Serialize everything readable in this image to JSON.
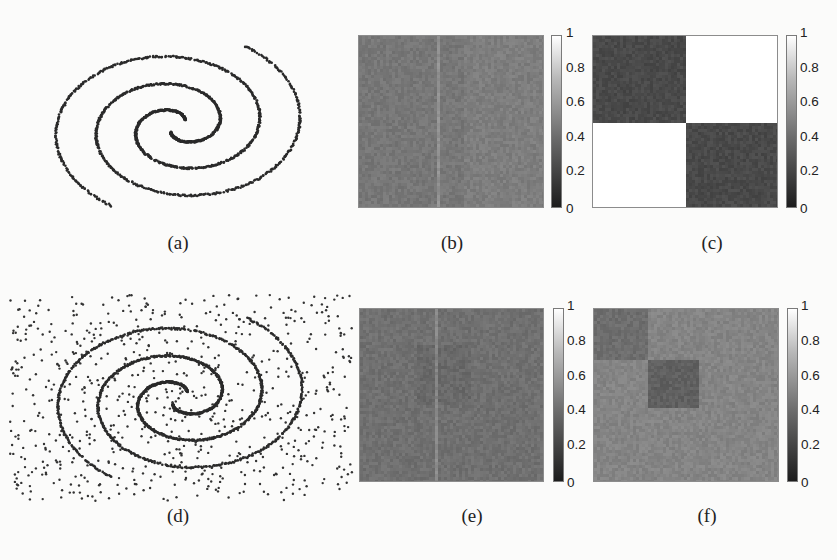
{
  "figure": {
    "panels": [
      {
        "id": "a",
        "label": "(a)",
        "kind": "scatter",
        "noise": false
      },
      {
        "id": "b",
        "label": "(b)",
        "kind": "heatmap"
      },
      {
        "id": "c",
        "label": "(c)",
        "kind": "heatmap"
      },
      {
        "id": "d",
        "label": "(d)",
        "kind": "scatter",
        "noise": true
      },
      {
        "id": "e",
        "label": "(e)",
        "kind": "heatmap"
      },
      {
        "id": "f",
        "label": "(f)",
        "kind": "heatmap"
      }
    ],
    "colorbar_ticks": [
      "1",
      "0.8",
      "0.6",
      "0.4",
      "0.2",
      "0"
    ]
  },
  "chart_data": [
    {
      "panel": "(a)",
      "type": "scatter",
      "title": "",
      "description": "Two interleaved noiseless spirals (two clusters)",
      "series": [
        {
          "name": "spiral 1"
        },
        {
          "name": "spiral 2"
        }
      ],
      "grid": false
    },
    {
      "panel": "(b)",
      "type": "heatmap",
      "description": "Affinity matrix for (a): nearly uniform mid-gray, no block structure",
      "mean_value": 0.4,
      "colorbar": {
        "ticks": [
          0,
          0.2,
          0.4,
          0.6,
          0.8,
          1
        ],
        "range": [
          0,
          1
        ]
      }
    },
    {
      "panel": "(c)",
      "type": "heatmap",
      "description": "Two-block structure: diagonal blocks dark, off-diagonal blocks white",
      "blocks": [
        [
          0.2,
          1.0
        ],
        [
          1.0,
          0.2
        ]
      ],
      "colorbar": {
        "ticks": [
          0,
          0.2,
          0.4,
          0.6,
          0.8,
          1
        ],
        "range": [
          0,
          1
        ]
      }
    },
    {
      "panel": "(d)",
      "type": "scatter",
      "title": "",
      "description": "Two interleaved spirals with uniform background noise points",
      "series": [
        {
          "name": "spiral 1"
        },
        {
          "name": "spiral 2"
        },
        {
          "name": "noise"
        }
      ],
      "grid": false
    },
    {
      "panel": "(e)",
      "type": "heatmap",
      "description": "Affinity matrix for (d): nearly uniform gray",
      "mean_value": 0.37,
      "colorbar": {
        "ticks": [
          0,
          0.2,
          0.4,
          0.6,
          0.8,
          1
        ],
        "range": [
          0,
          1
        ]
      }
    },
    {
      "panel": "(f)",
      "type": "heatmap",
      "description": "Two small darker diagonal blocks in upper-left, remaining area mid-gray",
      "blocks_description": "block1 rows/cols 0-0.28 ≈0.35; block2 rows/cols 0.28-0.56 ≈0.3; rest ≈0.45",
      "colorbar": {
        "ticks": [
          0,
          0.2,
          0.4,
          0.6,
          0.8,
          1
        ],
        "range": [
          0,
          1
        ]
      }
    }
  ]
}
